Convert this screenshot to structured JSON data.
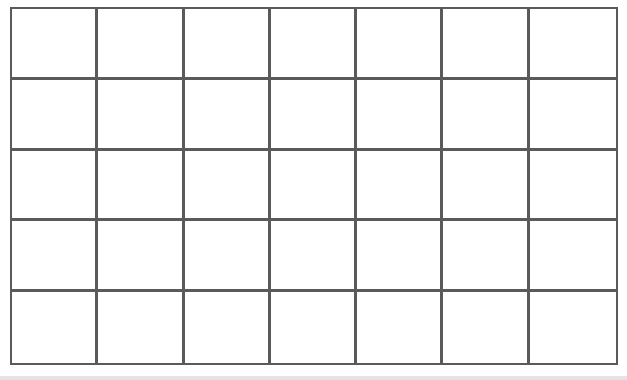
{
  "grid": {
    "rows": 5,
    "columns": 7,
    "line_color": "#5a5a5a",
    "cell_fill": "#ffffff"
  }
}
